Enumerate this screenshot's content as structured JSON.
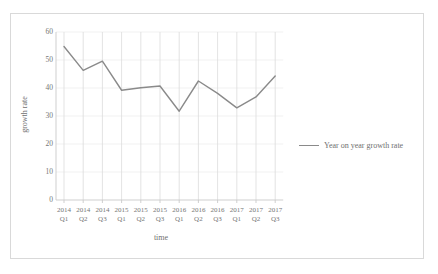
{
  "chart_data": {
    "type": "line",
    "title": "",
    "xlabel": "time",
    "ylabel": "growth rate",
    "categories": [
      "2014 Q1",
      "2014 Q2",
      "2014 Q3",
      "2015 Q1",
      "2015 Q2",
      "2015 Q3",
      "2016 Q1",
      "2016 Q2",
      "2016 Q3",
      "2017 Q1",
      "2017 Q2",
      "2017 Q3"
    ],
    "category_lines": [
      [
        "2014",
        "Q1"
      ],
      [
        "2014",
        "Q2"
      ],
      [
        "2014",
        "Q3"
      ],
      [
        "2015",
        "Q1"
      ],
      [
        "2015",
        "Q2"
      ],
      [
        "2015",
        "Q3"
      ],
      [
        "2016",
        "Q1"
      ],
      [
        "2016",
        "Q2"
      ],
      [
        "2016",
        "Q3"
      ],
      [
        "2017",
        "Q1"
      ],
      [
        "2017",
        "Q2"
      ],
      [
        "2017",
        "Q3"
      ]
    ],
    "series": [
      {
        "name": "Year on year growth rate",
        "values": [
          54.8,
          46.3,
          49.6,
          39.2,
          40.1,
          40.7,
          31.7,
          42.5,
          38.1,
          32.9,
          36.8,
          44.3
        ],
        "color": "#8a8a8a"
      }
    ],
    "ylim": [
      0,
      60
    ],
    "yticks": [
      0,
      10,
      20,
      30,
      40,
      50,
      60
    ],
    "grid": "vertical-category-lines",
    "legend_position": "right"
  },
  "legend": {
    "entries": [
      {
        "label": "Year on year growth rate"
      }
    ]
  },
  "axes": {
    "y_title": "growth rate",
    "x_title": "time"
  }
}
